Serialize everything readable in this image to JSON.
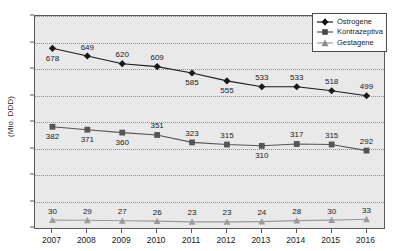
{
  "chart_data": {
    "type": "line",
    "title": "",
    "subtitle": "",
    "xlabel": "",
    "ylabel": "(Mio. DDD)",
    "categories": [
      "2007",
      "2008",
      "2009",
      "2010",
      "2011",
      "2012",
      "2013",
      "2014",
      "2015",
      "2016"
    ],
    "ylim": [
      0,
      800
    ],
    "ytick_labels": [
      "0",
      "100",
      "200",
      "300",
      "400",
      "500",
      "600",
      "700",
      "800"
    ],
    "ytick_values": [
      0,
      100,
      200,
      300,
      400,
      500,
      600,
      700,
      800
    ],
    "grid": true,
    "legend_position": "top-right",
    "series": [
      {
        "name": "Östrogene",
        "marker": "diamond",
        "color": "#1a1a1a",
        "values": [
          678,
          649,
          620,
          609,
          585,
          555,
          533,
          533,
          518,
          499
        ],
        "label_positions": [
          "below",
          "above",
          "above",
          "above",
          "below",
          "below",
          "above",
          "above",
          "above",
          "above"
        ]
      },
      {
        "name": "Kontrazeptiva",
        "marker": "square",
        "color": "#555555",
        "values": [
          382,
          371,
          360,
          351,
          323,
          315,
          310,
          317,
          315,
          292
        ],
        "label_positions": [
          "below",
          "below",
          "below",
          "above",
          "above",
          "above",
          "below",
          "above",
          "above",
          "above"
        ]
      },
      {
        "name": "Gestagene",
        "marker": "triangle",
        "color": "#9a9a9a",
        "values": [
          30,
          29,
          27,
          26,
          23,
          23,
          24,
          28,
          30,
          33
        ],
        "label_positions": [
          "above",
          "above",
          "above",
          "above",
          "above",
          "above",
          "above",
          "above",
          "above",
          "above"
        ]
      }
    ]
  },
  "legend": {
    "items": [
      {
        "label": "Östrogene",
        "marker": "diamond-marker-icon"
      },
      {
        "label": "Kontrazeptiva",
        "marker": "square-marker-icon"
      },
      {
        "label": "Gestagene",
        "marker": "triangle-marker-icon"
      }
    ]
  },
  "axes": {
    "y_title": "(Mio. DDD)"
  }
}
